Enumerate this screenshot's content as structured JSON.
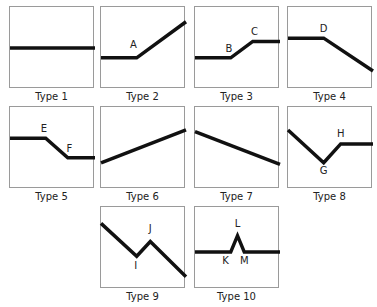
{
  "figure": {
    "panels": [
      {
        "caption": "Type 1",
        "points": [
          [
            0,
            0.5
          ],
          [
            1,
            0.5
          ]
        ],
        "labels": []
      },
      {
        "caption": "Type 2",
        "points": [
          [
            0,
            0.62
          ],
          [
            0.42,
            0.62
          ],
          [
            1,
            0.18
          ]
        ],
        "labels": [
          {
            "text": "A",
            "at": [
              0.38,
              0.5
            ]
          }
        ]
      },
      {
        "caption": "Type 3",
        "points": [
          [
            0,
            0.62
          ],
          [
            0.42,
            0.62
          ],
          [
            0.68,
            0.42
          ],
          [
            1,
            0.42
          ]
        ],
        "labels": [
          {
            "text": "B",
            "at": [
              0.4,
              0.55
            ]
          },
          {
            "text": "C",
            "at": [
              0.7,
              0.34
            ]
          }
        ]
      },
      {
        "caption": "Type 4",
        "points": [
          [
            0,
            0.38
          ],
          [
            0.42,
            0.38
          ],
          [
            1,
            0.78
          ]
        ],
        "labels": [
          {
            "text": "D",
            "at": [
              0.42,
              0.3
            ]
          }
        ]
      },
      {
        "caption": "Type 5",
        "points": [
          [
            0,
            0.38
          ],
          [
            0.42,
            0.38
          ],
          [
            0.68,
            0.62
          ],
          [
            1,
            0.62
          ]
        ],
        "labels": [
          {
            "text": "E",
            "at": [
              0.4,
              0.3
            ]
          },
          {
            "text": "F",
            "at": [
              0.7,
              0.55
            ]
          }
        ]
      },
      {
        "caption": "Type 6",
        "points": [
          [
            0,
            0.68
          ],
          [
            1,
            0.28
          ]
        ],
        "labels": []
      },
      {
        "caption": "Type 7",
        "points": [
          [
            0,
            0.3
          ],
          [
            1,
            0.7
          ]
        ],
        "labels": []
      },
      {
        "caption": "Type 8",
        "points": [
          [
            0,
            0.28
          ],
          [
            0.42,
            0.68
          ],
          [
            0.62,
            0.45
          ],
          [
            1,
            0.45
          ]
        ],
        "labels": [
          {
            "text": "G",
            "at": [
              0.42,
              0.82
            ]
          },
          {
            "text": "H",
            "at": [
              0.62,
              0.36
            ]
          }
        ]
      },
      {
        "caption": "Type 9",
        "points": [
          [
            0,
            0.2
          ],
          [
            0.42,
            0.6
          ],
          [
            0.58,
            0.42
          ],
          [
            1,
            0.85
          ]
        ],
        "labels": [
          {
            "text": "I",
            "at": [
              0.41,
              0.75
            ]
          },
          {
            "text": "J",
            "at": [
              0.58,
              0.3
            ]
          }
        ]
      },
      {
        "caption": "Type 10",
        "points": [
          [
            0,
            0.55
          ],
          [
            0.42,
            0.55
          ],
          [
            0.5,
            0.35
          ],
          [
            0.58,
            0.55
          ],
          [
            1,
            0.55
          ]
        ],
        "labels": [
          {
            "text": "K",
            "at": [
              0.36,
              0.7
            ]
          },
          {
            "text": "L",
            "at": [
              0.5,
              0.24
            ]
          },
          {
            "text": "M",
            "at": [
              0.58,
              0.7
            ]
          }
        ]
      }
    ]
  }
}
